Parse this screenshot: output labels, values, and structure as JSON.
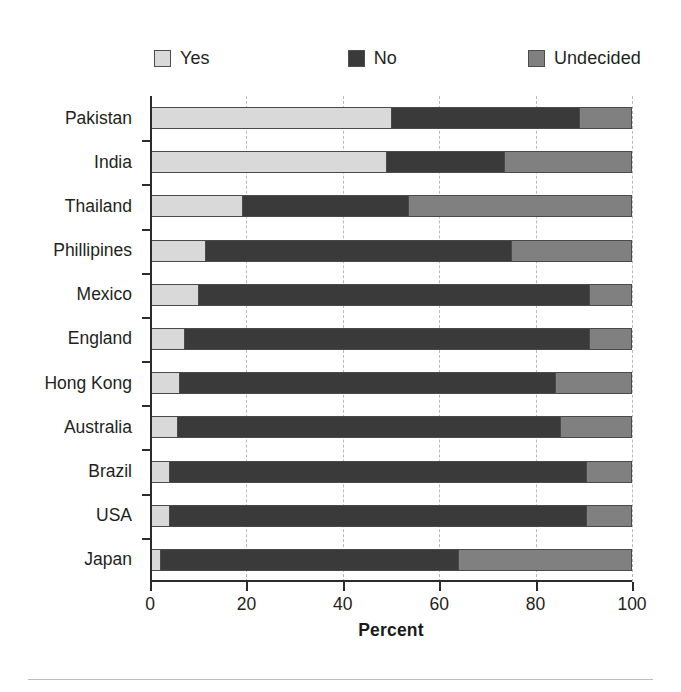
{
  "chart_data": {
    "type": "bar",
    "orientation": "horizontal",
    "stacked": true,
    "title": "",
    "xlabel": "Percent",
    "ylabel": "",
    "xlim": [
      0,
      100
    ],
    "xticks": [
      0,
      20,
      40,
      60,
      80,
      100
    ],
    "xticklabels": [
      "0",
      "20",
      "40",
      "60",
      "80",
      "100"
    ],
    "grid": "vertical-dashed",
    "legend_position": "top",
    "categories": [
      "Pakistan",
      "India",
      "Thailand",
      "Phillipines",
      "Mexico",
      "England",
      "Hong Kong",
      "Australia",
      "Brazil",
      "USA",
      "Japan"
    ],
    "series": [
      {
        "name": "Yes",
        "color": "#d9d9d9",
        "values": [
          50,
          49,
          19,
          11.5,
          10,
          7,
          6,
          5.5,
          4,
          4,
          2
        ]
      },
      {
        "name": "No",
        "color": "#3a3a3a",
        "values": [
          39,
          24.5,
          34.5,
          63.5,
          81,
          84,
          78,
          79.5,
          86.5,
          86.5,
          62
        ]
      },
      {
        "name": "Undecided",
        "color": "#808080",
        "values": [
          11,
          26.5,
          46.5,
          25,
          9,
          9,
          16,
          15,
          9.5,
          9.5,
          36
        ]
      }
    ],
    "totals": [
      100,
      100,
      100,
      100,
      100,
      100,
      100,
      100,
      100,
      100,
      100
    ]
  },
  "legend": {
    "items": [
      {
        "label": "Yes",
        "swatch_name": "legend-swatch-yes"
      },
      {
        "label": "No",
        "swatch_name": "legend-swatch-no"
      },
      {
        "label": "Undecided",
        "swatch_name": "legend-swatch-undecided"
      }
    ]
  },
  "axis": {
    "x_title": "Percent",
    "x_ticklabels": [
      "0",
      "20",
      "40",
      "60",
      "80",
      "100"
    ]
  }
}
